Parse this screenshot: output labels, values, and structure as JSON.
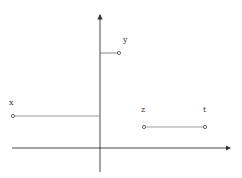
{
  "diagram": {
    "title": "",
    "labels": {
      "x": "x",
      "y": "y",
      "z": "z",
      "t": "t"
    },
    "colors": {
      "axis": "#333333",
      "segment": "#888888",
      "point": "#444444",
      "background": "#ffffff"
    },
    "axes": {
      "origin": [
        100,
        148
      ],
      "horizontal": {
        "from": [
          12,
          148
        ],
        "to": [
          230,
          148
        ],
        "arrow": true
      },
      "vertical": {
        "from": [
          100,
          172
        ],
        "to": [
          100,
          14
        ],
        "arrow": true
      }
    },
    "segments": [
      {
        "name": "x",
        "from": [
          13,
          116
        ],
        "to": [
          100,
          116
        ],
        "endpoint_dot": "left"
      },
      {
        "name": "y",
        "from": [
          100,
          53
        ],
        "to": [
          119,
          53
        ],
        "endpoint_dot": "right"
      },
      {
        "name": "z-t",
        "from": [
          144,
          127
        ],
        "to": [
          205,
          127
        ],
        "endpoint_dot": "both"
      }
    ]
  }
}
